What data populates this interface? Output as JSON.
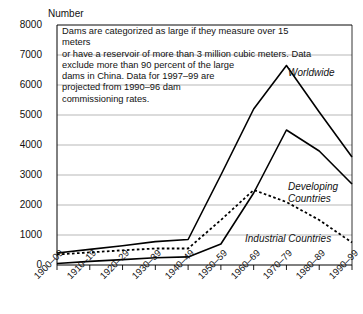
{
  "chart_data": {
    "type": "line",
    "title": "",
    "ylabel": "Number",
    "xlabel": "",
    "ylim": [
      0,
      8000
    ],
    "yticks": [
      0,
      1000,
      2000,
      3000,
      4000,
      5000,
      6000,
      7000,
      8000
    ],
    "ytick_labels": [
      "0",
      "1000",
      "2000",
      "3000",
      "4000",
      "5000",
      "6000",
      "7000",
      "8000"
    ],
    "grid": true,
    "legend_position": "inline-right",
    "categories": [
      "1900–09",
      "1910–19",
      "1920–29",
      "1930–39",
      "1940–49",
      "1950–59",
      "1960–69",
      "1970–79",
      "1980–89",
      "1990–99"
    ],
    "series": [
      {
        "name": "Worldwide",
        "style": "solid",
        "color": "#000000",
        "values": [
          400,
          520,
          640,
          780,
          850,
          3000,
          5200,
          6650,
          5100,
          3600
        ]
      },
      {
        "name": "Developing Countries",
        "style": "solid",
        "color": "#000000",
        "values": [
          50,
          120,
          180,
          240,
          270,
          700,
          2400,
          4500,
          3800,
          2700
        ]
      },
      {
        "name": "Industrial Countries",
        "style": "dotted",
        "color": "#000000",
        "values": [
          350,
          420,
          490,
          550,
          550,
          1500,
          2500,
          2100,
          1500,
          750
        ]
      }
    ],
    "annotation": {
      "lines": [
        "Dams are categorized as large if they measure over 15 meters",
        "or have a reservoir of more than 3 million cubic meters. Data",
        "exclude more than 90 percent of the large",
        "dams in China. Data for 1997–99 are",
        "projected from 1990–96 dam",
        "commissioning rates."
      ]
    }
  }
}
